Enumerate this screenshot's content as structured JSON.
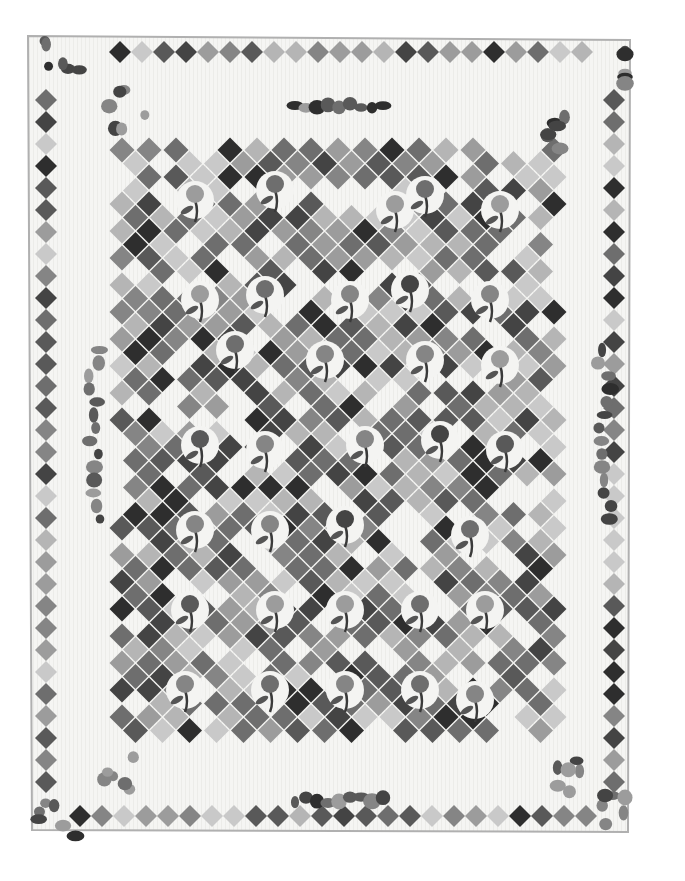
{
  "image": {
    "description": "Grayscale photograph of an appliqué and patchwork quilt with a field of diamond-set nine-patch blocks, appliquéd flowers, corner floral swags and a border of small diamond patches",
    "background": "#ffffff",
    "quilt_color": "#f4f4f2",
    "binding_color": "#b8b8b8"
  },
  "quilt": {
    "corners": {
      "tl": [
        28,
        36
      ],
      "tr": [
        630,
        40
      ],
      "br": [
        628,
        832
      ],
      "bl": [
        32,
        830
      ]
    },
    "border_diamond_size": 11,
    "border_top_y": 52,
    "border_bottom_y": 816,
    "border_left_x": 46,
    "border_right_x": 614,
    "border_step": 22,
    "field": {
      "x0": 122,
      "y0": 150,
      "x1": 560,
      "y1": 740,
      "step": 27,
      "size": 12.5
    }
  },
  "appliques": [
    {
      "type": "rose-corner",
      "x": 60,
      "y": 60
    },
    {
      "type": "grape-corner",
      "x": 640,
      "y": 65
    },
    {
      "type": "fern-corner",
      "x": 55,
      "y": 820
    },
    {
      "type": "carnation-corner",
      "x": 615,
      "y": 815
    },
    {
      "type": "swag-tl",
      "x": 130,
      "y": 110
    },
    {
      "type": "swag-tr",
      "x": 560,
      "y": 130
    },
    {
      "type": "swag-bl",
      "x": 120,
      "y": 770
    },
    {
      "type": "swag-br",
      "x": 560,
      "y": 775
    },
    {
      "type": "spray-top",
      "x": 340,
      "y": 105
    },
    {
      "type": "spray-bottom",
      "x": 340,
      "y": 800
    },
    {
      "type": "vine-left",
      "x": 95,
      "y": 440
    },
    {
      "type": "vine-right",
      "x": 605,
      "y": 440
    }
  ],
  "flowers": [
    [
      195,
      200
    ],
    [
      275,
      190
    ],
    [
      395,
      210
    ],
    [
      425,
      195
    ],
    [
      500,
      210
    ],
    [
      200,
      300
    ],
    [
      265,
      295
    ],
    [
      350,
      300
    ],
    [
      410,
      290
    ],
    [
      490,
      300
    ],
    [
      235,
      350
    ],
    [
      325,
      360
    ],
    [
      425,
      360
    ],
    [
      500,
      365
    ],
    [
      200,
      445
    ],
    [
      265,
      450
    ],
    [
      365,
      445
    ],
    [
      440,
      440
    ],
    [
      505,
      450
    ],
    [
      195,
      530
    ],
    [
      270,
      530
    ],
    [
      345,
      525
    ],
    [
      470,
      535
    ],
    [
      190,
      610
    ],
    [
      275,
      610
    ],
    [
      345,
      610
    ],
    [
      420,
      610
    ],
    [
      485,
      610
    ],
    [
      185,
      690
    ],
    [
      270,
      690
    ],
    [
      345,
      690
    ],
    [
      420,
      690
    ],
    [
      475,
      700
    ]
  ]
}
